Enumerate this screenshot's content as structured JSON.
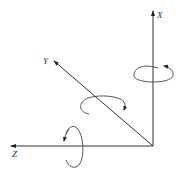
{
  "diagram": {
    "type": "3d-coordinate-axes-with-rotations",
    "axes": [
      {
        "id": "x",
        "label": "X",
        "direction": "up"
      },
      {
        "id": "y",
        "label": "Y",
        "direction": "up-left diagonal"
      },
      {
        "id": "z",
        "label": "Z",
        "direction": "left"
      }
    ],
    "rotations": [
      {
        "axis": "X",
        "description": "rotation arrow around X axis"
      },
      {
        "axis": "Y",
        "description": "rotation arrow around Y axis"
      },
      {
        "axis": "Z",
        "description": "rotation arrow around Z axis"
      }
    ],
    "colors": {
      "line": "#333333",
      "background": "#ffffff"
    }
  }
}
